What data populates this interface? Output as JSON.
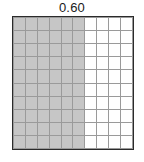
{
  "title": "0.60",
  "chart_data": {
    "type": "heatmap",
    "title": "0.60",
    "subtitle": "",
    "xlabel": "",
    "ylabel": "",
    "rows": 10,
    "columns": 10,
    "total_cells": 100,
    "shaded_cells": 60,
    "unshaded_cells": 40,
    "fraction_shaded": "60/100",
    "decimal_value": 0.6,
    "percent_shaded": 60,
    "shaded_columns": [
      1,
      2,
      3,
      4,
      5,
      6
    ],
    "unshaded_columns": [
      7,
      8,
      9,
      10
    ],
    "legend": [],
    "annotations": [],
    "grid": true,
    "colors": {
      "shaded": "#c6c6c6",
      "unshaded": "#ffffff",
      "gridline": "#2b2b2b",
      "cell_outline": "#9a9a9a",
      "title_text": "#1a1a1a",
      "background": "#ffffff"
    },
    "cells": [
      [
        1,
        1,
        1,
        1,
        1,
        1,
        0,
        0,
        0,
        0
      ],
      [
        1,
        1,
        1,
        1,
        1,
        1,
        0,
        0,
        0,
        0
      ],
      [
        1,
        1,
        1,
        1,
        1,
        1,
        0,
        0,
        0,
        0
      ],
      [
        1,
        1,
        1,
        1,
        1,
        1,
        0,
        0,
        0,
        0
      ],
      [
        1,
        1,
        1,
        1,
        1,
        1,
        0,
        0,
        0,
        0
      ],
      [
        1,
        1,
        1,
        1,
        1,
        1,
        0,
        0,
        0,
        0
      ],
      [
        1,
        1,
        1,
        1,
        1,
        1,
        0,
        0,
        0,
        0
      ],
      [
        1,
        1,
        1,
        1,
        1,
        1,
        0,
        0,
        0,
        0
      ],
      [
        1,
        1,
        1,
        1,
        1,
        1,
        0,
        0,
        0,
        0
      ],
      [
        1,
        1,
        1,
        1,
        1,
        1,
        0,
        0,
        0,
        0
      ]
    ]
  }
}
